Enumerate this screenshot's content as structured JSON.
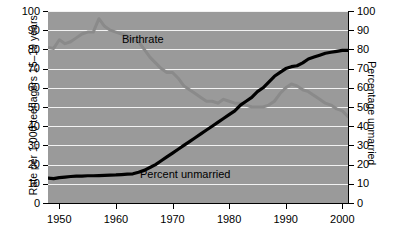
{
  "chart_data": {
    "type": "line",
    "title": "",
    "subtitle": "",
    "xlabel": "",
    "ylabel": "Rate per 1,000 teenagers 15–19 years",
    "ylabel_right": "Percentage unmarried",
    "xlim": [
      1948,
      2001
    ],
    "ylim": [
      0,
      100
    ],
    "ylim_right": [
      0,
      100
    ],
    "grid": true,
    "grid_color": "#f2f2f2",
    "plot_background": "#9a9a9a",
    "legend_position": "inline-annotations",
    "xticks": [
      1950,
      1960,
      1970,
      1980,
      1990,
      2000
    ],
    "xticklabels": [
      "1950",
      "1960",
      "1970",
      "1980",
      "1990",
      "2000"
    ],
    "yticks": [
      0,
      10,
      20,
      30,
      40,
      50,
      60,
      70,
      80,
      90,
      100
    ],
    "yticklabels": [
      "0",
      "10",
      "20",
      "30",
      "40",
      "50",
      "60",
      "70",
      "80",
      "90",
      "100"
    ],
    "yticks_right": [
      0,
      10,
      20,
      30,
      40,
      50,
      60,
      70,
      80,
      90,
      100
    ],
    "yticklabels_right": [
      "0",
      "10",
      "20",
      "30",
      "40",
      "50",
      "60",
      "70",
      "80",
      "90",
      "100"
    ],
    "annotations": [
      {
        "text": "Birthrate",
        "series": "Birthrate"
      },
      {
        "text": "Percent unmarried",
        "series": "Percent unmarried"
      }
    ],
    "series": [
      {
        "name": "Birthrate",
        "axis": "left",
        "color": "#8a8a8a",
        "linewidth": 3,
        "x": [
          1948,
          1949,
          1950,
          1951,
          1952,
          1953,
          1954,
          1955,
          1956,
          1957,
          1958,
          1959,
          1960,
          1961,
          1962,
          1963,
          1964,
          1965,
          1966,
          1967,
          1968,
          1969,
          1970,
          1971,
          1972,
          1973,
          1974,
          1975,
          1976,
          1977,
          1978,
          1979,
          1980,
          1981,
          1982,
          1983,
          1984,
          1985,
          1986,
          1987,
          1988,
          1989,
          1990,
          1991,
          1992,
          1993,
          1994,
          1995,
          1996,
          1997,
          1998,
          1999,
          2000,
          2001
        ],
        "values": [
          81,
          80.5,
          85,
          83,
          84,
          86,
          88,
          89,
          89,
          96,
          92,
          90,
          89,
          88,
          87,
          85,
          84,
          80,
          76,
          73,
          70,
          68,
          68,
          65,
          61,
          59,
          57,
          55,
          53,
          53,
          52,
          54,
          53,
          52,
          52,
          51,
          50,
          50,
          50,
          51,
          53,
          57,
          60,
          62,
          61,
          59,
          58,
          56,
          54,
          52,
          51,
          49,
          48,
          45
        ]
      },
      {
        "name": "Percent unmarried",
        "axis": "right",
        "color": "#000000",
        "linewidth": 3.2,
        "x": [
          1948,
          1949,
          1950,
          1951,
          1952,
          1953,
          1954,
          1955,
          1956,
          1957,
          1958,
          1959,
          1960,
          1961,
          1962,
          1963,
          1964,
          1965,
          1966,
          1967,
          1968,
          1969,
          1970,
          1971,
          1972,
          1973,
          1974,
          1975,
          1976,
          1977,
          1978,
          1979,
          1980,
          1981,
          1982,
          1983,
          1984,
          1985,
          1986,
          1987,
          1988,
          1989,
          1990,
          1991,
          1992,
          1993,
          1994,
          1995,
          1996,
          1997,
          1998,
          1999,
          2000,
          2001
        ],
        "values": [
          13,
          12.7,
          13.2,
          13.5,
          13.8,
          14,
          14,
          14.2,
          14.2,
          14.3,
          14.4,
          14.5,
          14.6,
          14.8,
          15,
          15.2,
          16,
          17,
          18.5,
          20,
          22,
          24,
          26,
          28,
          30,
          32,
          34,
          36,
          38,
          40,
          42,
          44,
          46,
          48,
          51,
          53,
          55,
          58,
          60,
          63,
          66,
          68,
          70,
          71,
          71.5,
          73,
          75,
          76,
          77,
          78,
          78.5,
          79,
          79.5,
          79.5
        ]
      }
    ]
  },
  "axes": {
    "left_title": "Rate per 1,000 teenagers 15–19 years",
    "right_title": "Percentage unmarried"
  },
  "annotations": {
    "birthrate": "Birthrate",
    "percent_unmarried": "Percent unmarried"
  }
}
